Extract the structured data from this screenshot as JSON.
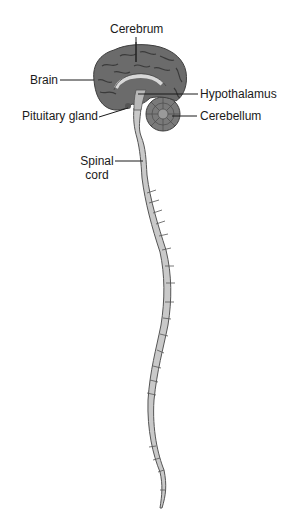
{
  "diagram": {
    "type": "anatomical-illustration",
    "labels": [
      {
        "id": "cerebrum",
        "text": "Cerebrum"
      },
      {
        "id": "brain",
        "text": "Brain"
      },
      {
        "id": "hypothalamus",
        "text": "Hypothalamus"
      },
      {
        "id": "pituitary",
        "text": "Pituitary gland"
      },
      {
        "id": "cerebellum",
        "text": "Cerebellum"
      },
      {
        "id": "spinal_line1",
        "text": "Spinal"
      },
      {
        "id": "spinal_line2",
        "text": "cord"
      }
    ],
    "colors": {
      "brain_fill": "#6b6b6b",
      "brain_dark": "#3f3f3f",
      "cord_fill": "#c9c9c9",
      "outline": "#4a4a4a",
      "leader": "#1a1a1a"
    }
  }
}
